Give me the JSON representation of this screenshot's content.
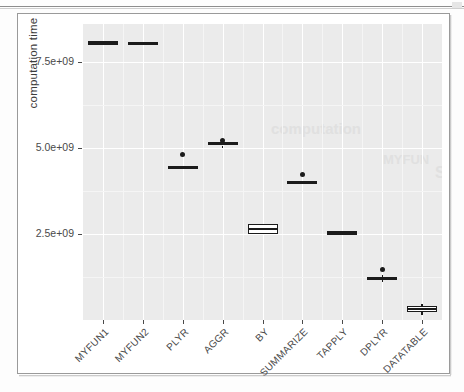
{
  "chart_data": {
    "type": "boxplot",
    "title": "",
    "xlabel": "",
    "ylabel": "computation time",
    "grid": true,
    "legend": "none",
    "ylim": [
      0,
      8600000000
    ],
    "ytick_values": [
      2500000000,
      5000000000,
      7500000000
    ],
    "ytick_labels": [
      "2.5e+09",
      "5.0e+09",
      "7.5e+09"
    ],
    "categories": [
      "MYFUN1",
      "MYFUN2",
      "PLYR",
      "AGGR",
      "BY",
      "SUMMARIZE",
      "TAPPLY",
      "DPLYR",
      "DATATABLE"
    ],
    "boxes": [
      {
        "category": "MYFUN1",
        "median": 8050000000,
        "q1": 8000000000,
        "q3": 8100000000,
        "whisker_low": 8000000000,
        "whisker_high": 8100000000,
        "outliers": [],
        "style": "solid"
      },
      {
        "category": "MYFUN2",
        "median": 8030000000,
        "q1": 7980000000,
        "q3": 8080000000,
        "whisker_low": 7980000000,
        "whisker_high": 8080000000,
        "outliers": [],
        "style": "solid"
      },
      {
        "category": "PLYR",
        "median": 4430000000,
        "q1": 4380000000,
        "q3": 4480000000,
        "whisker_low": 4380000000,
        "whisker_high": 4480000000,
        "outliers": [
          4800000000
        ],
        "style": "solid"
      },
      {
        "category": "AGGR",
        "median": 5120000000,
        "q1": 5070000000,
        "q3": 5180000000,
        "whisker_low": 5000000000,
        "whisker_high": 5250000000,
        "outliers": [
          5230000000
        ],
        "style": "solid"
      },
      {
        "category": "BY",
        "median": 2640000000,
        "q1": 2500000000,
        "q3": 2790000000,
        "whisker_low": 2500000000,
        "whisker_high": 2790000000,
        "outliers": [],
        "style": "open"
      },
      {
        "category": "SUMMARIZE",
        "median": 4000000000,
        "q1": 3960000000,
        "q3": 4050000000,
        "whisker_low": 3960000000,
        "whisker_high": 4050000000,
        "outliers": [
          4240000000
        ],
        "style": "solid"
      },
      {
        "category": "TAPPLY",
        "median": 2530000000,
        "q1": 2480000000,
        "q3": 2590000000,
        "whisker_low": 2480000000,
        "whisker_high": 2590000000,
        "outliers": [],
        "style": "solid"
      },
      {
        "category": "DPLYR",
        "median": 1200000000,
        "q1": 1160000000,
        "q3": 1250000000,
        "whisker_low": 1100000000,
        "whisker_high": 1320000000,
        "outliers": [
          1480000000
        ],
        "style": "solid"
      },
      {
        "category": "DATATABLE",
        "median": 310000000,
        "q1": 220000000,
        "q3": 410000000,
        "whisker_low": 140000000,
        "whisker_high": 480000000,
        "outliers": [],
        "style": "open"
      }
    ],
    "colors": {
      "panel_background": "#ebebeb",
      "grid_major": "#ffffff",
      "grid_minor": "#f5f5f5",
      "box_stroke": "#1b1b1b",
      "box_fill_open": "#ffffff",
      "axis_text": "#4a4a4a",
      "axis_title": "#3c3c3c"
    }
  }
}
